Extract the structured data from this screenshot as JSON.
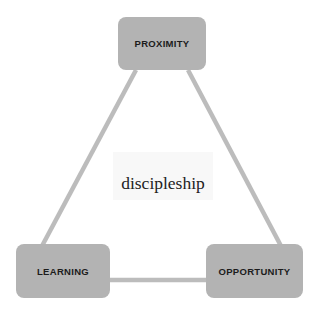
{
  "diagram": {
    "type": "triangle-cycle",
    "center_label": "discipleship",
    "nodes": {
      "top": {
        "label": "PROXIMITY"
      },
      "bottom_left": {
        "label": "LEARNING"
      },
      "bottom_right": {
        "label": "OPPORTUNITY"
      }
    },
    "edges": [
      {
        "from": "PROXIMITY",
        "to": "LEARNING"
      },
      {
        "from": "PROXIMITY",
        "to": "OPPORTUNITY"
      },
      {
        "from": "LEARNING",
        "to": "OPPORTUNITY"
      }
    ],
    "colors": {
      "node_fill": "#b3b3b3",
      "node_text": "#1c1c1c",
      "edge": "#bcbcbc",
      "center_bg": "#f8f8f8",
      "center_text": "#222222",
      "background": "#ffffff"
    }
  }
}
